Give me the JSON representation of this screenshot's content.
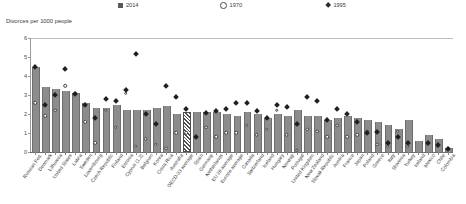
{
  "chart": {
    "axis_title": "Divorces per 1000 people",
    "ylabel": "Divorces per 1000 people",
    "legend": [
      {
        "label": "2014",
        "marker": "bar-swatch"
      },
      {
        "label": "1970",
        "marker": "open-circle"
      },
      {
        "label": "1995",
        "marker": "filled-diamond"
      }
    ],
    "yticks": [
      "0",
      "1",
      "2",
      "3",
      "4",
      "5",
      "6"
    ]
  },
  "chart_data": {
    "type": "bar",
    "title": "",
    "subtitle": "",
    "xlabel": "",
    "ylabel": "Divorces per 1000 people",
    "ylim": [
      0,
      6
    ],
    "yticks": [
      0,
      1,
      2,
      3,
      4,
      5,
      6
    ],
    "grid": false,
    "legend_position": "top",
    "categories": [
      "Russian Fed.",
      "Denmark",
      "Lithuania",
      "United States",
      "Latvia",
      "Sweden",
      "Luxembourg",
      "Czech Republic",
      "Finland",
      "Estonia",
      "Cyprus (1,2)",
      "Belgium",
      "Korea",
      "Costa Rica",
      "Australia",
      "OECD-33 average",
      "Spain",
      "Germany",
      "Netherlands",
      "EU 28 average",
      "Europe average",
      "Canada",
      "Switzerland",
      "Iceland",
      "Hungary",
      "Norway",
      "Portugal",
      "United Kingdom",
      "New Zealand",
      "Slovak Republic",
      "Austria",
      "France",
      "Japan",
      "Poland",
      "Greece",
      "Italy",
      "Slovenia",
      "Turkey",
      "Ireland",
      "Mexico",
      "Chile",
      "Colombia"
    ],
    "series": [
      {
        "name": "2014",
        "marker": "bar",
        "values": [
          4.5,
          3.4,
          3.3,
          3.2,
          3.1,
          2.6,
          2.3,
          2.3,
          2.5,
          2.2,
          2.2,
          2.2,
          2.3,
          2.4,
          2.0,
          2.0,
          2.1,
          2.1,
          2.1,
          2.0,
          1.9,
          2.1,
          2.0,
          1.8,
          2.0,
          1.9,
          2.2,
          1.9,
          1.9,
          1.7,
          1.8,
          1.9,
          1.8,
          1.7,
          1.6,
          1.4,
          1.2,
          1.7,
          0.6,
          0.9,
          0.7,
          0.2
        ]
      },
      {
        "name": "1970",
        "marker": "open-circle",
        "values": [
          2.6,
          1.9,
          2.2,
          3.5,
          3.1,
          1.6,
          0.5,
          2.2,
          1.3,
          3.1,
          0.3,
          0.7,
          0.4,
          0.2,
          1.0,
          1.0,
          0.0,
          1.3,
          0.8,
          1.0,
          1.0,
          1.4,
          0.9,
          1.2,
          2.2,
          0.9,
          0.1,
          1.2,
          1.1,
          0.8,
          1.4,
          0.8,
          0.9,
          1.1,
          0.4,
          0.3,
          1.1,
          0.3,
          0.0,
          0.4,
          0.3,
          0.2
        ]
      },
      {
        "name": "1995",
        "marker": "filled-diamond",
        "values": [
          4.5,
          2.5,
          3.0,
          4.4,
          3.1,
          2.5,
          1.8,
          2.8,
          2.7,
          3.3,
          5.2,
          2.0,
          1.5,
          3.5,
          2.9,
          2.3,
          0.8,
          2.1,
          2.2,
          2.3,
          2.6,
          2.6,
          2.2,
          1.8,
          2.5,
          2.4,
          1.5,
          2.9,
          2.7,
          1.7,
          2.3,
          2.0,
          1.6,
          1.0,
          1.1,
          0.5,
          0.8,
          0.5,
          0.0,
          0.5,
          0.4,
          0.2
        ]
      }
    ]
  }
}
